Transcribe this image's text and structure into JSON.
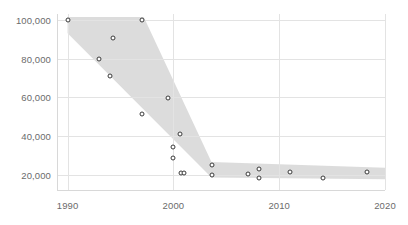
{
  "chart_data": {
    "type": "scatter",
    "title": "",
    "xlabel": "",
    "ylabel": "",
    "xlim": [
      1989.0,
      2020.0
    ],
    "ylim": [
      12000,
      103000
    ],
    "grid": true,
    "legend": "none",
    "xticks": [
      1990,
      2000,
      2010,
      2020
    ],
    "xtick_labels": [
      "1990",
      "2000",
      "2010",
      "2020"
    ],
    "yticks": [
      20000,
      40000,
      60000,
      80000,
      100000
    ],
    "ytick_labels": [
      "20,000",
      "40,000",
      "60,000",
      "80,000",
      "100,000"
    ],
    "marker_style": "open-circle",
    "marker_edge_color": "#3a3a3a",
    "marker_face_color": "#ffffff",
    "band_color": "#d9d9d9",
    "band_label": "shaded trend band",
    "grid_color": "#e3e3e3",
    "tick_label_color": "#6b6b6b",
    "background_color": "#ffffff",
    "points": [
      {
        "x": 1990.0,
        "y": 100000
      },
      {
        "x": 1993.0,
        "y": 80000
      },
      {
        "x": 1994.3,
        "y": 90500
      },
      {
        "x": 1994.0,
        "y": 71000
      },
      {
        "x": 1997.0,
        "y": 100000
      },
      {
        "x": 1997.0,
        "y": 51500
      },
      {
        "x": 1999.5,
        "y": 59500
      },
      {
        "x": 2000.6,
        "y": 41000
      },
      {
        "x": 2000.0,
        "y": 34500
      },
      {
        "x": 2000.0,
        "y": 28500
      },
      {
        "x": 2000.7,
        "y": 21000
      },
      {
        "x": 2001.0,
        "y": 21000
      },
      {
        "x": 2003.6,
        "y": 25000
      },
      {
        "x": 2003.6,
        "y": 20000
      },
      {
        "x": 2007.0,
        "y": 20500
      },
      {
        "x": 2008.1,
        "y": 23000
      },
      {
        "x": 2008.1,
        "y": 18000
      },
      {
        "x": 2011.0,
        "y": 21500
      },
      {
        "x": 2014.1,
        "y": 18000
      },
      {
        "x": 2018.3,
        "y": 21500
      }
    ],
    "band_polygon": [
      {
        "x": 1990.0,
        "y": 101500
      },
      {
        "x": 1997.2,
        "y": 101500
      },
      {
        "x": 2003.6,
        "y": 26500
      },
      {
        "x": 2020.0,
        "y": 23500
      },
      {
        "x": 2020.0,
        "y": 17500
      },
      {
        "x": 2003.6,
        "y": 18500
      },
      {
        "x": 1990.0,
        "y": 93000
      }
    ]
  }
}
